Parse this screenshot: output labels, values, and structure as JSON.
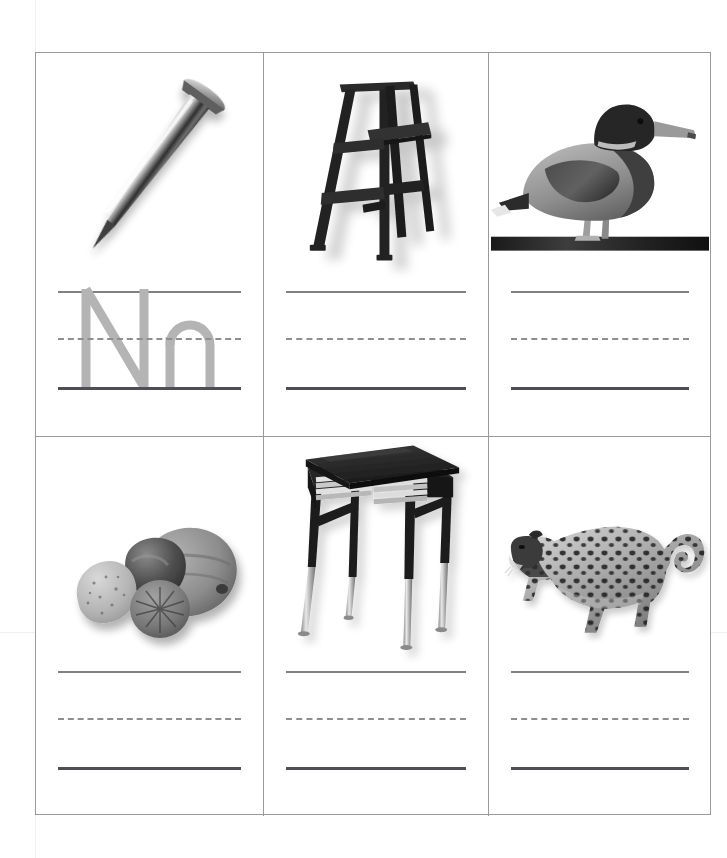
{
  "worksheet": {
    "title": "Letter Nn Picture and Handwriting Practice Worksheet",
    "letter_uppercase": "N",
    "letter_lowercase": "n",
    "trace_letter_color": "#b4b4b4",
    "grid_line_color": "#9a9a9a",
    "baseline_color": "#4c4f55",
    "topline_color": "#7e8186",
    "dashed_line_color": "#8b8e93",
    "background_color": "#ffffff",
    "columns": 3,
    "rows": 2
  },
  "cells": [
    {
      "position": "row-1-col-1",
      "picture_name": "nail",
      "picture_alt": "A steel nail angled with flat head at the upper right and sharp point at the lower left",
      "has_trace_letters": true,
      "trace_text": "Nn",
      "writing_lines": [
        "top-line",
        "dashed-midline",
        "baseline"
      ]
    },
    {
      "position": "row-1-col-2",
      "picture_name": "ladder",
      "picture_alt": "A dark wooden A-frame stepladder",
      "has_trace_letters": false,
      "trace_text": "",
      "writing_lines": [
        "top-line",
        "dashed-midline",
        "baseline"
      ]
    },
    {
      "position": "row-1-col-3",
      "picture_name": "duck",
      "picture_alt": "A mallard duck standing on a dark bar",
      "has_trace_letters": false,
      "trace_text": "",
      "writing_lines": [
        "top-line",
        "dashed-midline",
        "baseline"
      ]
    },
    {
      "position": "row-2-col-1",
      "picture_name": "nuts",
      "picture_alt": "Four nuts in shells including a walnut, an almond and a hazelnut",
      "has_trace_letters": false,
      "trace_text": "",
      "writing_lines": [
        "top-line",
        "dashed-midline",
        "baseline"
      ]
    },
    {
      "position": "row-2-col-2",
      "picture_name": "desk",
      "picture_alt": "A black school desk with books stacked inside and chrome adjustable legs",
      "has_trace_letters": false,
      "trace_text": "",
      "writing_lines": [
        "top-line",
        "dashed-midline",
        "baseline"
      ]
    },
    {
      "position": "row-2-col-3",
      "picture_name": "leopard",
      "picture_alt": "A spotted leopard walking with its tail curled upward",
      "has_trace_letters": false,
      "trace_text": "",
      "writing_lines": [
        "top-line",
        "dashed-midline",
        "baseline"
      ]
    }
  ]
}
